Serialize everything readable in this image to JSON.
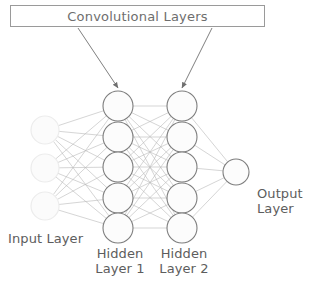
{
  "diagram": {
    "type": "neural-network-architecture",
    "background_color": "#ffffff",
    "annotation_box": {
      "label": "Convolutional Layers",
      "border_color": "#9a9a9a",
      "text_color": "#6e6e6e",
      "arrow_targets": [
        "Hidden Layer 1",
        "Hidden Layer 2"
      ]
    },
    "labels": {
      "input": "Input Layer",
      "hidden1": "Hidden\nLayer 1",
      "hidden2": "Hidden\nLayer 2",
      "output": "Output Layer"
    },
    "layers": [
      {
        "name": "Input Layer",
        "node_count": 3,
        "node_radius": 14,
        "center_x": 45,
        "node_y": [
          130,
          168,
          206
        ],
        "stroke_color": "#ececec",
        "fill_color": "#fbfbfb",
        "faded": true
      },
      {
        "name": "Hidden Layer 1",
        "node_count": 5,
        "node_radius": 15,
        "center_x": 118,
        "node_y": [
          106,
          137,
          167,
          198,
          228
        ],
        "stroke_color": "#7d7d7d",
        "fill_color": "#fcfcfc",
        "faded": false
      },
      {
        "name": "Hidden Layer 2",
        "node_count": 5,
        "node_radius": 15,
        "center_x": 182,
        "node_y": [
          106,
          137,
          167,
          198,
          228
        ],
        "stroke_color": "#7d7d7d",
        "fill_color": "#fcfcfc",
        "faded": false
      },
      {
        "name": "Output Layer",
        "node_count": 1,
        "node_radius": 13,
        "center_x": 236,
        "node_y": [
          172
        ],
        "stroke_color": "#7d7d7d",
        "fill_color": "#fcfcfc",
        "faded": false
      }
    ],
    "connections": {
      "style": "fully-connected",
      "line_color": "#b9b9b9",
      "line_width": 0.6
    },
    "arrows": [
      {
        "from_x": 78,
        "from_y": 28,
        "to_x": 118,
        "to_y": 88,
        "color": "#7f7f7f"
      },
      {
        "from_x": 212,
        "from_y": 28,
        "to_x": 182,
        "to_y": 88,
        "color": "#7f7f7f"
      }
    ]
  }
}
